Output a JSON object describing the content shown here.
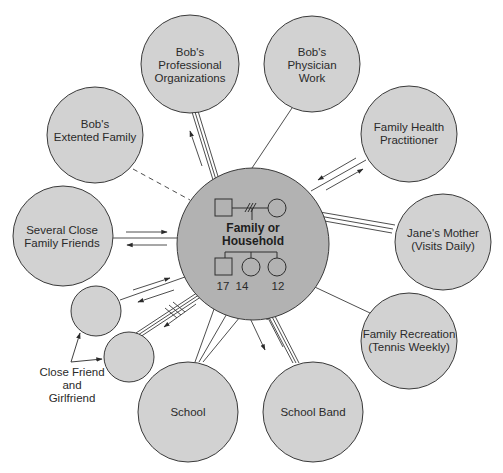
{
  "diagram": {
    "type": "ecomap",
    "colors": {
      "outer_circle_fill": "#d2d2d2",
      "center_circle_fill": "#b2b2b2",
      "stroke": "#3a3a3a",
      "background": "#ffffff"
    },
    "center": {
      "label_line1": "Family or",
      "label_line2": "Household",
      "members": [
        {
          "symbol": "male",
          "role": "Bob"
        },
        {
          "symbol": "female",
          "role": "Jane"
        },
        {
          "symbol": "male",
          "age": "17"
        },
        {
          "symbol": "female",
          "age": "14"
        },
        {
          "symbol": "female",
          "age": "12"
        }
      ],
      "marital_line": "divorced/conflict hatch"
    },
    "nodes": [
      {
        "id": "bobs-professional-organizations",
        "lines": [
          "Bob's",
          "Professional",
          "Organizations"
        ],
        "connection": "strong",
        "flow": "to node"
      },
      {
        "id": "bobs-physician-work",
        "lines": [
          "Bob's",
          "Physician",
          "Work"
        ],
        "connection": "normal"
      },
      {
        "id": "bobs-extended-family",
        "lines": [
          "Bob's",
          "Extented Family"
        ],
        "connection": "tenuous"
      },
      {
        "id": "family-health-practitioner",
        "lines": [
          "Family Health",
          "Practitioner"
        ],
        "connection": "normal",
        "flow": "both ways"
      },
      {
        "id": "several-close-family-friends",
        "lines": [
          "Several Close",
          "Family Friends"
        ],
        "connection": "normal",
        "flow": "both ways"
      },
      {
        "id": "janes-mother",
        "lines": [
          "Jane's Mother",
          "(Visits Daily)"
        ],
        "connection": "strong"
      },
      {
        "id": "close-friend",
        "lines": [],
        "connection": "normal",
        "flow": "both ways"
      },
      {
        "id": "girlfriend",
        "lines": [],
        "connection": "strong-stressful",
        "flow": "to node"
      },
      {
        "id": "family-recreation",
        "lines": [
          "Family Recreation",
          "(Tennis Weekly)"
        ],
        "connection": "normal"
      },
      {
        "id": "school",
        "lines": [
          "School"
        ],
        "connection": "normal"
      },
      {
        "id": "school-band",
        "lines": [
          "School Band"
        ],
        "connection": "strong",
        "flow": "both ways"
      }
    ],
    "annotation": {
      "lines": [
        "Close Friend",
        "and",
        "Girlfriend"
      ]
    }
  }
}
